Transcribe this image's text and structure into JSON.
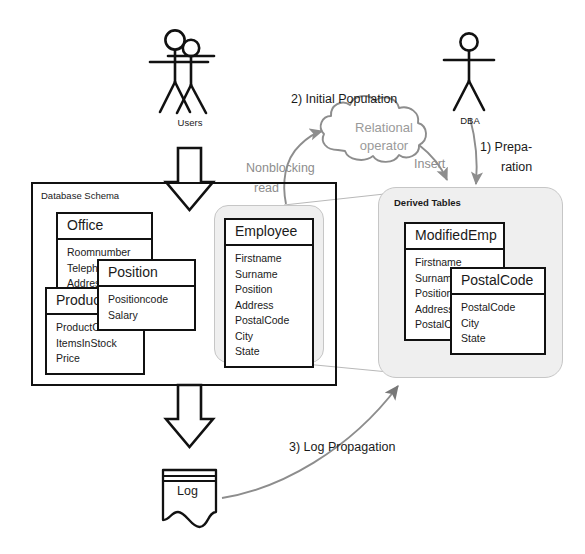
{
  "diagram": {
    "colors": {
      "ink": "#111111",
      "gray_line": "#8d8d8d",
      "soft_fill": "#efefef",
      "soft_border": "#c6c6c6",
      "cloud_text": "#9a9a9a"
    }
  },
  "actors": [
    {
      "id": "users",
      "label": "Users",
      "icon": "stick-figure-pair-icon"
    },
    {
      "id": "dba",
      "label": "DBA",
      "icon": "stick-figure-icon"
    }
  ],
  "regions": {
    "schema": {
      "label": "Database Schema"
    },
    "derived": {
      "label": "Derived Tables"
    }
  },
  "cloud": {
    "line1": "Relational",
    "line2": "operator"
  },
  "flows": [
    {
      "id": "step1",
      "label_line1": "1) Prepa-",
      "label_line2": "ration"
    },
    {
      "id": "step2",
      "label": "2) Initial Population"
    },
    {
      "id": "step3",
      "label": "3) Log Propagation"
    },
    {
      "id": "nonblocking",
      "label_line1": "Nonblocking",
      "label_line2": "read"
    },
    {
      "id": "insert",
      "label": "Insert"
    }
  ],
  "log": {
    "label": "Log"
  },
  "tables": {
    "office": {
      "name": "Office",
      "attrs": [
        "Roomnumber",
        "Telephone",
        "Address",
        "City"
      ]
    },
    "position": {
      "name": "Position",
      "attrs": [
        "Positioncode",
        "Salary"
      ]
    },
    "product": {
      "name": "Product",
      "attrs": [
        "ProductCode",
        "ItemsInStock",
        "Price"
      ]
    },
    "employee": {
      "name": "Employee",
      "attrs": [
        "Firstname",
        "Surname",
        "Position",
        "Address",
        "PostalCode",
        "City",
        "State"
      ]
    },
    "modifiedemp": {
      "name": "ModifiedEmp",
      "attrs": [
        "Firstname",
        "Surname",
        "Position",
        "Address",
        "PostalCode"
      ]
    },
    "postalcode": {
      "name": "PostalCode",
      "attrs": [
        "PostalCode",
        "City",
        "State"
      ]
    }
  }
}
